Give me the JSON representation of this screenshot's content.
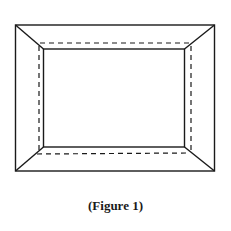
{
  "figure": {
    "caption": "(Figure 1)",
    "stroke_color": "#1a1a1a",
    "background": "#ffffff"
  }
}
